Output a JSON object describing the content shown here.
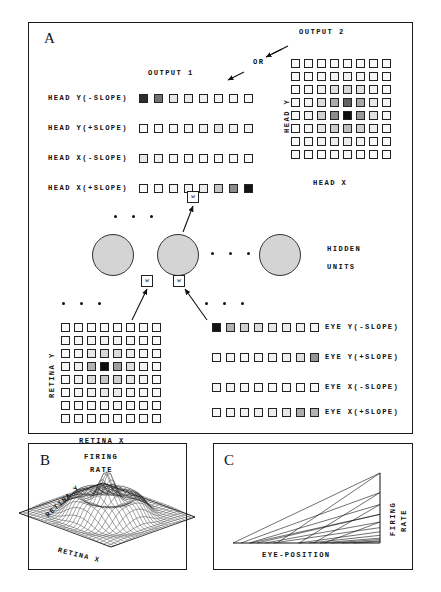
{
  "figure": {
    "panels": [
      {
        "id": "A",
        "label": "A"
      },
      {
        "id": "B",
        "label": "B"
      },
      {
        "id": "C",
        "label": "C"
      }
    ]
  },
  "panelA": {
    "output1_title": "OUTPUT  1",
    "output2_title": "OUTPUT  2",
    "or_label": "OR",
    "hidden_line1": "HIDDEN",
    "hidden_line2": "UNITS",
    "weight_label": "w",
    "head_axis_x": "HEAD  X",
    "head_axis_y": "HEAD  Y",
    "retina_axis_x": "RETINA  X",
    "retina_axis_y": "RETINA  Y",
    "output_rows": [
      {
        "label": "HEAD Y(-SLOPE)",
        "n": 8,
        "shades": [
          0.82,
          0.55,
          0.1,
          0.08,
          0.06,
          0.04,
          0.03,
          0.02
        ]
      },
      {
        "label": "HEAD Y(+SLOPE)",
        "n": 8,
        "shades": [
          0.02,
          0.02,
          0.03,
          0.04,
          0.05,
          0.1,
          0.06,
          0.05
        ]
      },
      {
        "label": "HEAD X(-SLOPE)",
        "n": 8,
        "shades": [
          0.1,
          0.05,
          0.04,
          0.03,
          0.03,
          0.02,
          0.02,
          0.02
        ]
      },
      {
        "label": "HEAD X(+SLOPE)",
        "n": 8,
        "shades": [
          0.02,
          0.03,
          0.04,
          0.05,
          0.08,
          0.22,
          0.45,
          0.92
        ]
      }
    ],
    "eye_rows": [
      {
        "label": "EYE  Y(-SLOPE)",
        "n": 8,
        "shades": [
          0.92,
          0.3,
          0.18,
          0.14,
          0.1,
          0.08,
          0.06,
          0.04
        ]
      },
      {
        "label": "EYE  Y(+SLOPE)",
        "n": 8,
        "shades": [
          0.02,
          0.03,
          0.03,
          0.04,
          0.05,
          0.06,
          0.12,
          0.42
        ]
      },
      {
        "label": "EYE  X(-SLOPE)",
        "n": 8,
        "shades": [
          0.04,
          0.04,
          0.03,
          0.03,
          0.03,
          0.03,
          0.02,
          0.02
        ]
      },
      {
        "label": "EYE  X(+SLOPE)",
        "n": 8,
        "shades": [
          0.03,
          0.04,
          0.05,
          0.06,
          0.07,
          0.1,
          0.32,
          0.3
        ]
      }
    ],
    "output2_grid": {
      "rows": 8,
      "cols": 8,
      "shades": [
        [
          0.02,
          0.02,
          0.02,
          0.02,
          0.02,
          0.02,
          0.02,
          0.02
        ],
        [
          0.02,
          0.02,
          0.03,
          0.04,
          0.05,
          0.04,
          0.03,
          0.02
        ],
        [
          0.02,
          0.03,
          0.06,
          0.12,
          0.16,
          0.12,
          0.05,
          0.02
        ],
        [
          0.02,
          0.04,
          0.14,
          0.32,
          0.62,
          0.34,
          0.1,
          0.03
        ],
        [
          0.03,
          0.05,
          0.18,
          0.45,
          0.95,
          0.4,
          0.12,
          0.03
        ],
        [
          0.02,
          0.04,
          0.1,
          0.2,
          0.26,
          0.18,
          0.07,
          0.02
        ],
        [
          0.02,
          0.03,
          0.05,
          0.07,
          0.08,
          0.06,
          0.03,
          0.02
        ],
        [
          0.02,
          0.02,
          0.02,
          0.03,
          0.03,
          0.02,
          0.02,
          0.02
        ]
      ]
    },
    "retina_grid": {
      "rows": 8,
      "cols": 8,
      "shades": [
        [
          0.02,
          0.02,
          0.02,
          0.02,
          0.02,
          0.02,
          0.02,
          0.02
        ],
        [
          0.02,
          0.03,
          0.04,
          0.05,
          0.05,
          0.04,
          0.03,
          0.02
        ],
        [
          0.02,
          0.04,
          0.1,
          0.16,
          0.14,
          0.08,
          0.04,
          0.02
        ],
        [
          0.03,
          0.06,
          0.3,
          0.95,
          0.38,
          0.12,
          0.05,
          0.02
        ],
        [
          0.02,
          0.05,
          0.14,
          0.22,
          0.18,
          0.09,
          0.04,
          0.02
        ],
        [
          0.02,
          0.03,
          0.06,
          0.09,
          0.08,
          0.05,
          0.03,
          0.02
        ],
        [
          0.02,
          0.02,
          0.03,
          0.04,
          0.04,
          0.03,
          0.02,
          0.02
        ],
        [
          0.02,
          0.02,
          0.02,
          0.02,
          0.02,
          0.02,
          0.02,
          0.02
        ]
      ]
    },
    "hidden_units_count": 3,
    "ellipsis_groups": 4
  },
  "panelB": {
    "title_line1": "FIRING",
    "title_line2": "RATE",
    "axis_x": "RETINA X",
    "axis_y": "RETINA Y",
    "plot_type": "3d-mesh-surface"
  },
  "panelC": {
    "axis_x": "EYE-POSITION",
    "axis_y_line1": "FIRING",
    "axis_y_line2": "RATE",
    "plot_type": "line-fan",
    "line_count": 12
  },
  "chart_data": [
    {
      "type": "heatmap",
      "title": "OUTPUT  2",
      "xlabel": "HEAD  X",
      "ylabel": "HEAD  Y",
      "rows": 8,
      "cols": 8,
      "values": [
        [
          0.02,
          0.02,
          0.02,
          0.02,
          0.02,
          0.02,
          0.02,
          0.02
        ],
        [
          0.02,
          0.02,
          0.03,
          0.04,
          0.05,
          0.04,
          0.03,
          0.02
        ],
        [
          0.02,
          0.03,
          0.06,
          0.12,
          0.16,
          0.12,
          0.05,
          0.02
        ],
        [
          0.02,
          0.04,
          0.14,
          0.32,
          0.62,
          0.34,
          0.1,
          0.03
        ],
        [
          0.03,
          0.05,
          0.18,
          0.45,
          0.95,
          0.4,
          0.12,
          0.03
        ],
        [
          0.02,
          0.04,
          0.1,
          0.2,
          0.26,
          0.18,
          0.07,
          0.02
        ],
        [
          0.02,
          0.03,
          0.05,
          0.07,
          0.08,
          0.06,
          0.03,
          0.02
        ],
        [
          0.02,
          0.02,
          0.02,
          0.03,
          0.03,
          0.02,
          0.02,
          0.02
        ]
      ],
      "grid": true,
      "legend": "none"
    },
    {
      "type": "heatmap",
      "title": "RETINA",
      "xlabel": "RETINA  X",
      "ylabel": "RETINA  Y",
      "rows": 8,
      "cols": 8,
      "values": [
        [
          0.02,
          0.02,
          0.02,
          0.02,
          0.02,
          0.02,
          0.02,
          0.02
        ],
        [
          0.02,
          0.03,
          0.04,
          0.05,
          0.05,
          0.04,
          0.03,
          0.02
        ],
        [
          0.02,
          0.04,
          0.1,
          0.16,
          0.14,
          0.08,
          0.04,
          0.02
        ],
        [
          0.03,
          0.06,
          0.3,
          0.95,
          0.38,
          0.12,
          0.05,
          0.02
        ],
        [
          0.02,
          0.05,
          0.14,
          0.22,
          0.18,
          0.09,
          0.04,
          0.02
        ],
        [
          0.02,
          0.03,
          0.06,
          0.09,
          0.08,
          0.05,
          0.03,
          0.02
        ],
        [
          0.02,
          0.02,
          0.03,
          0.04,
          0.04,
          0.03,
          0.02,
          0.02
        ],
        [
          0.02,
          0.02,
          0.02,
          0.02,
          0.02,
          0.02,
          0.02,
          0.02
        ]
      ],
      "grid": true,
      "legend": "none"
    },
    {
      "type": "bar",
      "title": "OUTPUT  1 head-centered population code",
      "categories": [
        "1",
        "2",
        "3",
        "4",
        "5",
        "6",
        "7",
        "8"
      ],
      "series": [
        {
          "name": "HEAD Y(-SLOPE)",
          "values": [
            0.82,
            0.55,
            0.1,
            0.08,
            0.06,
            0.04,
            0.03,
            0.02
          ]
        },
        {
          "name": "HEAD Y(+SLOPE)",
          "values": [
            0.02,
            0.02,
            0.03,
            0.04,
            0.05,
            0.1,
            0.06,
            0.05
          ]
        },
        {
          "name": "HEAD X(-SLOPE)",
          "values": [
            0.1,
            0.05,
            0.04,
            0.03,
            0.03,
            0.02,
            0.02,
            0.02
          ]
        },
        {
          "name": "HEAD X(+SLOPE)",
          "values": [
            0.02,
            0.03,
            0.04,
            0.05,
            0.08,
            0.22,
            0.45,
            0.92
          ]
        }
      ],
      "xlabel": "unit index",
      "ylabel": "activation",
      "ylim": [
        0,
        1
      ]
    },
    {
      "type": "bar",
      "title": "EYE-POSITION input units",
      "categories": [
        "1",
        "2",
        "3",
        "4",
        "5",
        "6",
        "7",
        "8"
      ],
      "series": [
        {
          "name": "EYE  Y(-SLOPE)",
          "values": [
            0.92,
            0.3,
            0.18,
            0.14,
            0.1,
            0.08,
            0.06,
            0.04
          ]
        },
        {
          "name": "EYE  Y(+SLOPE)",
          "values": [
            0.02,
            0.03,
            0.03,
            0.04,
            0.05,
            0.06,
            0.12,
            0.42
          ]
        },
        {
          "name": "EYE  X(-SLOPE)",
          "values": [
            0.04,
            0.04,
            0.03,
            0.03,
            0.03,
            0.03,
            0.02,
            0.02
          ]
        },
        {
          "name": "EYE  X(+SLOPE)",
          "values": [
            0.03,
            0.04,
            0.05,
            0.06,
            0.07,
            0.1,
            0.32,
            0.3
          ]
        }
      ],
      "xlabel": "unit index",
      "ylabel": "activation",
      "ylim": [
        0,
        1
      ]
    },
    {
      "type": "area",
      "title": "FIRING RATE over retina (panel B)",
      "xlabel": "RETINA X",
      "ylabel": "RETINA Y",
      "zlabel": "FIRING RATE",
      "grid": true,
      "legend": "none"
    },
    {
      "type": "line",
      "title": "Firing rate vs eye position (panel C)",
      "xlabel": "EYE-POSITION",
      "ylabel": "FIRING RATE",
      "series": [
        {
          "name": "unit 1",
          "values": [
            0.0,
            1.0
          ]
        },
        {
          "name": "unit 2",
          "values": [
            0.0,
            0.72
          ]
        },
        {
          "name": "unit 3",
          "values": [
            0.0,
            0.55
          ]
        },
        {
          "name": "unit 4",
          "values": [
            0.0,
            0.41
          ]
        },
        {
          "name": "unit 5",
          "values": [
            0.0,
            0.3
          ]
        },
        {
          "name": "unit 6",
          "values": [
            0.0,
            0.22
          ]
        },
        {
          "name": "unit 7",
          "values": [
            0.0,
            0.16
          ]
        },
        {
          "name": "unit 8",
          "values": [
            0.0,
            0.11
          ]
        },
        {
          "name": "unit 9",
          "values": [
            0.0,
            0.07
          ]
        },
        {
          "name": "unit 10",
          "values": [
            0.0,
            0.05
          ]
        },
        {
          "name": "unit 11",
          "values": [
            0.0,
            0.03
          ]
        },
        {
          "name": "unit 12",
          "values": [
            0.0,
            0.02
          ]
        }
      ],
      "xlim": [
        0,
        1
      ],
      "ylim": [
        0,
        1
      ],
      "grid": false,
      "legend": "none"
    }
  ]
}
